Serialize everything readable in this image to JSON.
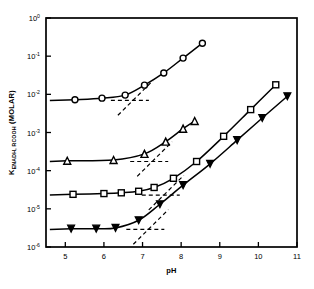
{
  "chart_data": {
    "type": "scatter",
    "title": "",
    "subtitle": "",
    "xlabel": "pH",
    "ylabel": "K_ENADH, RCOOH (MOLAR)",
    "ylabel_parts": {
      "symbol": "K",
      "subscript": "ENADH, RCOOH",
      "units": "(MOLAR)"
    },
    "xlim": [
      4.5,
      11.0
    ],
    "ylim_log10": [
      -6,
      0
    ],
    "xscale": "linear",
    "yscale": "log",
    "grid": false,
    "legend": "none",
    "xticks": [
      5,
      6,
      7,
      8,
      9,
      10,
      11
    ],
    "xtick_labels": [
      "5",
      "6",
      "7",
      "8",
      "9",
      "10",
      "11"
    ],
    "yticks_log10": [
      0,
      -1,
      -2,
      -3,
      -4,
      -5,
      -6
    ],
    "ytick_labels": [
      "10⁰",
      "10⁻¹",
      "10⁻²",
      "10⁻³",
      "10⁻⁴",
      "10⁻⁵",
      "10⁻⁶"
    ],
    "ytick_mantissa": "10",
    "ytick_exponents": [
      "0",
      "-1",
      "-2",
      "-3",
      "-4",
      "-5",
      "-6"
    ],
    "series": [
      {
        "name": "open-circle-series",
        "marker": "circle-open",
        "marker_size": 6,
        "color": "#000000",
        "points": [
          {
            "x": 5.25,
            "y_log10": -2.14
          },
          {
            "x": 5.95,
            "y_log10": -2.1
          },
          {
            "x": 6.55,
            "y_log10": -2.02
          },
          {
            "x": 7.05,
            "y_log10": -1.76
          },
          {
            "x": 7.55,
            "y_log10": -1.44
          },
          {
            "x": 8.05,
            "y_log10": -1.05
          },
          {
            "x": 8.55,
            "y_log10": -0.66
          }
        ],
        "plateau_y_log10": -2.16,
        "plateau_x_start": 4.6,
        "plateau_x_end": 5.25,
        "pka_marker_x": 6.75
      },
      {
        "name": "open-triangle-up-series",
        "marker": "triangle-up-open",
        "marker_size": 7,
        "color": "#000000",
        "points": [
          {
            "x": 5.05,
            "y_log10": -3.74
          },
          {
            "x": 6.25,
            "y_log10": -3.72
          },
          {
            "x": 7.05,
            "y_log10": -3.56
          },
          {
            "x": 7.6,
            "y_log10": -3.24
          },
          {
            "x": 8.05,
            "y_log10": -2.9
          },
          {
            "x": 8.35,
            "y_log10": -2.7
          }
        ],
        "plateau_y_log10": -3.76,
        "plateau_x_start": 4.6,
        "plateau_x_end": 5.05,
        "pka_marker_x": 7.25
      },
      {
        "name": "open-square-series",
        "marker": "square-open",
        "marker_size": 6,
        "color": "#000000",
        "points": [
          {
            "x": 5.2,
            "y_log10": -4.62
          },
          {
            "x": 6.0,
            "y_log10": -4.6
          },
          {
            "x": 6.45,
            "y_log10": -4.58
          },
          {
            "x": 6.9,
            "y_log10": -4.54
          },
          {
            "x": 7.3,
            "y_log10": -4.44
          },
          {
            "x": 7.8,
            "y_log10": -4.2
          },
          {
            "x": 8.4,
            "y_log10": -3.76
          },
          {
            "x": 9.1,
            "y_log10": -3.1
          },
          {
            "x": 9.8,
            "y_log10": -2.4
          },
          {
            "x": 10.45,
            "y_log10": -1.75
          }
        ],
        "plateau_y_log10": -4.64,
        "plateau_x_start": 4.6,
        "plateau_x_end": 5.2,
        "pka_marker_x": 7.55
      },
      {
        "name": "filled-triangle-down-series",
        "marker": "triangle-down-filled",
        "marker_size": 7,
        "color": "#000000",
        "points": [
          {
            "x": 5.15,
            "y_log10": -5.52
          },
          {
            "x": 5.8,
            "y_log10": -5.52
          },
          {
            "x": 6.3,
            "y_log10": -5.5
          },
          {
            "x": 6.9,
            "y_log10": -5.3
          },
          {
            "x": 7.45,
            "y_log10": -4.88
          },
          {
            "x": 8.05,
            "y_log10": -4.38
          },
          {
            "x": 8.75,
            "y_log10": -3.82
          },
          {
            "x": 9.45,
            "y_log10": -3.2
          },
          {
            "x": 10.1,
            "y_log10": -2.62
          },
          {
            "x": 10.75,
            "y_log10": -2.05
          }
        ],
        "plateau_y_log10": -5.54,
        "plateau_x_start": 4.6,
        "plateau_x_end": 5.15,
        "pka_marker_x": 7.15
      }
    ],
    "pka_guides": [
      {
        "series": "open-circle-series",
        "x": 6.75,
        "y_log10": -2.14,
        "note": "dashed plateau and dashed slope intersection"
      },
      {
        "series": "open-triangle-up-series",
        "x": 7.25,
        "y_log10": -3.74,
        "note": "dashed plateau and dashed slope intersection"
      },
      {
        "series": "open-square-series",
        "x": 7.55,
        "y_log10": -4.62,
        "note": "dashed plateau and dashed slope intersection"
      },
      {
        "series": "filled-triangle-down-series",
        "x": 7.15,
        "y_log10": -5.52,
        "note": "dashed plateau and dashed slope intersection"
      }
    ]
  },
  "axes": {
    "x_axis_label": "pH",
    "y_axis_symbol": "K",
    "y_axis_subscript": "ENADH, RCOOH",
    "y_axis_units": "(MOLAR)"
  },
  "colors": {
    "line": "#000000",
    "background": "#ffffff",
    "frame": "#000000"
  }
}
